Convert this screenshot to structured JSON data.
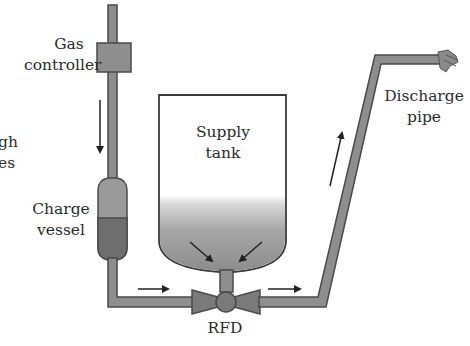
{
  "labels": {
    "gas_controller": [
      "Gas",
      "controller"
    ],
    "charge_vessel": [
      "Charge",
      "vessel"
    ],
    "supply_tank": [
      "Supply",
      "tank"
    ],
    "discharge_pipe": [
      "Discharge",
      "pipe"
    ],
    "rfd": "RFD",
    "cutoff_left": [
      "gh",
      "es",
      "l"
    ]
  },
  "colors": {
    "pipe_fill": "#8e8e8e",
    "pipe_stroke": "#4a4a4a",
    "vessel_upper": "#9a9a9a",
    "vessel_lower": "#6e6e6e",
    "tank_stroke": "#3a3a3a",
    "tank_gradient_top": "#ffffff",
    "tank_gradient_bottom": "#8a8a8a",
    "arrow": "#222222",
    "text": "#2b2b2b"
  }
}
